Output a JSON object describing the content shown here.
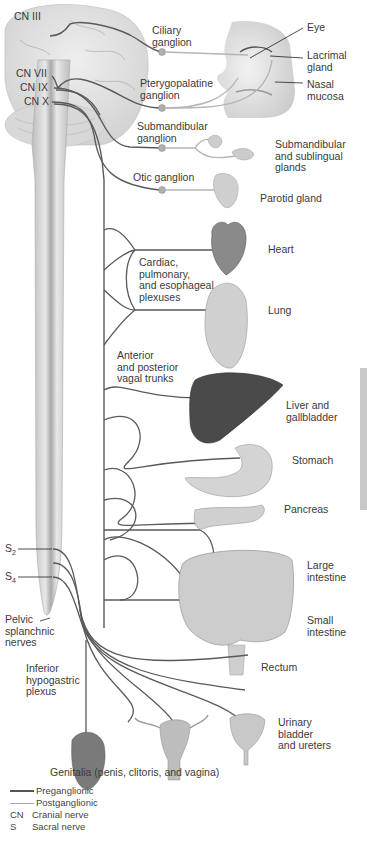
{
  "colors": {
    "preganglionic": "#5a5a5a",
    "postganglionic": "#b5b5b5",
    "ganglion": "#a8a8a8",
    "organ_light": "#d9d9d9",
    "organ_dark": "#4a4a4a",
    "spinal_cord": "#cfcfcf",
    "side_bar": "#c8c8c8"
  },
  "cranial_nerves": [
    {
      "label": "CN III"
    },
    {
      "label": "CN VII"
    },
    {
      "label": "CN IX"
    },
    {
      "label": "CN X"
    }
  ],
  "ganglia": [
    {
      "label": "Ciliary\nganglion"
    },
    {
      "label": "Pterygopalatine\nganglion"
    },
    {
      "label": "Submandibular\nganglion"
    },
    {
      "label": "Otic ganglion"
    }
  ],
  "head_targets": [
    {
      "label": "Eye"
    },
    {
      "label": "Lacrimal\ngland"
    },
    {
      "label": "Nasal\nmucosa"
    },
    {
      "label": "Submandibular\nand sublingual\nglands"
    },
    {
      "label": "Parotid gland"
    }
  ],
  "plexus_labels": [
    {
      "label": "Cardiac,\npulmonary,\nand esophageal\nplexuses"
    },
    {
      "label": "Anterior\nand posterior\nvagal trunks"
    },
    {
      "label": "Inferior\nhypogastric\nplexus"
    }
  ],
  "organs": [
    {
      "label": "Heart"
    },
    {
      "label": "Lung"
    },
    {
      "label": "Liver and\ngallbladder"
    },
    {
      "label": "Stomach"
    },
    {
      "label": "Pancreas"
    },
    {
      "label": "Large\nintestine"
    },
    {
      "label": "Small\nintestine"
    },
    {
      "label": "Rectum"
    },
    {
      "label": "Urinary\nbladder\nand ureters"
    }
  ],
  "sacral": {
    "s2": "S",
    "s2_sub": "2",
    "s4": "S",
    "s4_sub": "4",
    "pelvic_label": "Pelvic\nsplanchnic\nnerves"
  },
  "genitalia_caption": "Genitalia (penis, clitoris, and vagina)",
  "legend": {
    "preganglionic": "Preganglionic",
    "postganglionic": "Postganglionic",
    "abbreviations": [
      {
        "abbr": "CN",
        "meaning": "Cranial nerve"
      },
      {
        "abbr": "S",
        "meaning": "Sacral nerve"
      }
    ]
  }
}
